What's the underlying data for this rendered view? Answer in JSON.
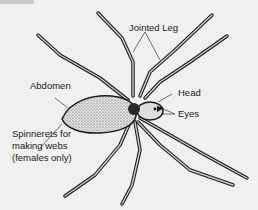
{
  "diagram": {
    "labels": {
      "jointed_leg": "Jointed Leg",
      "abdomen": "Abdomen",
      "head": "Head",
      "eyes": "Eyes",
      "spinnerets_line1": "Spinnerets for",
      "spinnerets_line2": "making webs",
      "spinnerets_line3": "(females only)"
    },
    "colors": {
      "background": "#f0f0f0",
      "ink": "#1a1a1a",
      "body_fill": "#d8d8d8"
    }
  }
}
